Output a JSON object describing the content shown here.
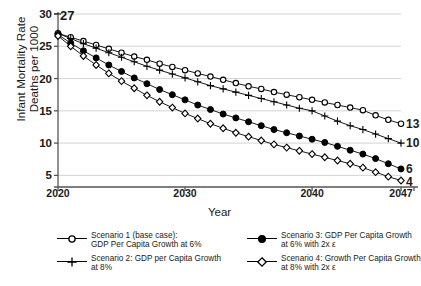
{
  "chart_data": {
    "type": "line",
    "title": "",
    "xlabel": "Year",
    "ylabel": "Infant Mortality Rate\nDeaths per 1000",
    "xlim": [
      2020,
      2047
    ],
    "ylim": [
      3.2,
      30
    ],
    "xticks": [
      2020,
      2030,
      2040,
      2047
    ],
    "yticks": [
      30,
      25,
      20,
      15,
      10,
      5
    ],
    "grid": true,
    "legend_position": "below",
    "start_annotation": "27",
    "x": [
      2020,
      2021,
      2022,
      2023,
      2024,
      2025,
      2026,
      2027,
      2028,
      2029,
      2030,
      2031,
      2032,
      2033,
      2034,
      2035,
      2036,
      2037,
      2038,
      2039,
      2040,
      2041,
      2042,
      2043,
      2044,
      2045,
      2046,
      2047
    ],
    "series": [
      {
        "name": "Scenario 1 (base case): GDP Per Capita Growth at 6%",
        "marker": "open-circle",
        "end_value": 13,
        "end_label": "13",
        "values": [
          27.0,
          26.4,
          25.8,
          25.2,
          24.6,
          24.0,
          23.4,
          22.9,
          22.3,
          21.8,
          21.3,
          20.8,
          20.3,
          19.8,
          19.3,
          18.8,
          18.4,
          17.9,
          17.5,
          17.1,
          16.7,
          16.3,
          15.9,
          15.5,
          15.1,
          14.3,
          13.6,
          13.0
        ]
      },
      {
        "name": "Scenario 2: GDP per Capita Growth at 8%",
        "marker": "plus",
        "end_value": 10,
        "end_label": "10",
        "values": [
          27.0,
          26.2,
          25.4,
          24.7,
          24.0,
          23.3,
          22.6,
          21.9,
          21.3,
          20.7,
          20.1,
          19.5,
          18.9,
          18.4,
          17.9,
          17.4,
          16.9,
          16.4,
          15.9,
          15.4,
          15.0,
          14.2,
          13.4,
          12.7,
          12.1,
          11.4,
          10.7,
          10.0
        ]
      },
      {
        "name": "Scenario 3: GDP Per Capita Growth at 6% with 2x ε",
        "marker": "filled-circle",
        "end_value": 6,
        "end_label": "6",
        "values": [
          26.8,
          25.5,
          24.3,
          23.2,
          22.1,
          21.1,
          20.1,
          19.2,
          18.3,
          17.5,
          16.7,
          15.9,
          15.2,
          14.5,
          13.9,
          13.3,
          12.7,
          12.1,
          11.6,
          11.1,
          10.6,
          10.1,
          9.5,
          8.9,
          8.3,
          7.6,
          6.8,
          6.0
        ]
      },
      {
        "name": "Scenario 4: Growth Per Capita Growth at 8% with 2x ε",
        "marker": "open-diamond",
        "end_value": 4,
        "end_label": "4",
        "values": [
          26.6,
          25.0,
          23.5,
          22.1,
          20.8,
          19.6,
          18.5,
          17.4,
          16.4,
          15.5,
          14.6,
          13.8,
          13.0,
          12.3,
          11.6,
          11.0,
          10.4,
          9.8,
          9.3,
          8.8,
          8.3,
          7.8,
          7.3,
          6.8,
          6.2,
          5.5,
          4.8,
          4.2
        ]
      }
    ]
  },
  "axis": {
    "ylabel_line1": "Infant Mortality Rate",
    "ylabel_line2": "Deaths per 1000",
    "ylabel_text": "Infant Mortality Rate\nDeaths per 1000",
    "xlabel_text": "Year"
  },
  "legend": {
    "items": [
      {
        "marker": "open-circle",
        "line1": "Scenario 1 (base case):",
        "line2": "GDP Per Capita Growth at 6%",
        "text": "Scenario 1 (base case):\nGDP Per Capita Growth at 6%"
      },
      {
        "marker": "plus",
        "line1": " Scenario 2: GDP per Capita Growth",
        "line2": "at 8%",
        "text": " Scenario 2: GDP per Capita Growth\nat 8%"
      },
      {
        "marker": "filled-circle",
        "line1": "Scenario 3: GDP Per Capita Growth",
        "line2": "at 6% with 2x ε",
        "text": "Scenario 3: GDP Per Capita Growth\nat 6% with 2x ε"
      },
      {
        "marker": "open-diamond",
        "line1": "Scenario 4: Growth Per Capita Growth",
        "line2": "at 8% with 2x ε",
        "text": "Scenario 4: Growth Per Capita Growth\nat 8% with 2x ε"
      }
    ]
  },
  "colors": {
    "line": "#000000",
    "grid": "#c8c8c8",
    "axis": "#555555",
    "background": "#ffffff"
  }
}
